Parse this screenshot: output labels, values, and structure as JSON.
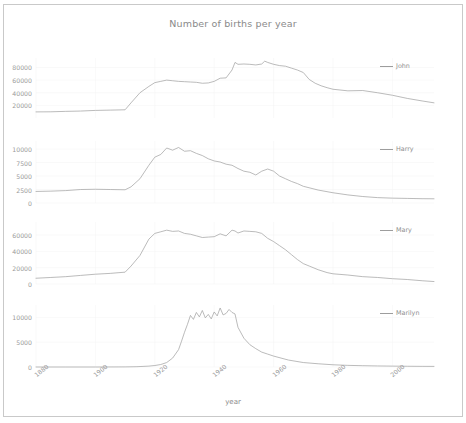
{
  "figure": {
    "title": "Number of births per year",
    "xlabel": "year",
    "background": "#ffffff",
    "line_color": "#9d9d9d",
    "text_color": "#8f8f8f"
  },
  "chart_data": {
    "type": "line",
    "title": "Number of births per year",
    "xlabel": "year",
    "ylabel": "",
    "grid": true,
    "legend_position": "upper right",
    "shared_x": true,
    "xlim": [
      1880,
      2014
    ],
    "xticks": [
      1880,
      1900,
      1920,
      1940,
      1960,
      1980,
      2000
    ],
    "subplots": [
      {
        "name": "John",
        "legend": "John",
        "ylim": [
          0,
          95000
        ],
        "yticks": [
          20000,
          40000,
          60000,
          80000
        ],
        "x": [
          1880,
          1885,
          1890,
          1895,
          1900,
          1905,
          1910,
          1912,
          1915,
          1918,
          1920,
          1922,
          1924,
          1926,
          1928,
          1930,
          1932,
          1934,
          1936,
          1938,
          1940,
          1942,
          1944,
          1946,
          1947,
          1948,
          1950,
          1952,
          1954,
          1956,
          1957,
          1958,
          1960,
          1962,
          1964,
          1966,
          1968,
          1970,
          1972,
          1974,
          1976,
          1978,
          1980,
          1985,
          1990,
          1995,
          2000,
          2005,
          2010,
          2014
        ],
        "y": [
          9655,
          9800,
          10500,
          11000,
          12000,
          12500,
          13000,
          24000,
          40000,
          50000,
          56000,
          58000,
          60000,
          59000,
          58000,
          57500,
          57000,
          56500,
          55000,
          55500,
          58000,
          63000,
          63500,
          76000,
          88000,
          85000,
          85500,
          85000,
          84000,
          85500,
          90000,
          88000,
          85000,
          83000,
          82000,
          79000,
          76000,
          72000,
          61000,
          55000,
          51000,
          48000,
          45500,
          43000,
          43500,
          40000,
          36000,
          31000,
          27000,
          24000
        ]
      },
      {
        "name": "Harry",
        "legend": "Harry",
        "ylim": [
          0,
          11500
        ],
        "yticks": [
          0,
          2500,
          5000,
          7500,
          10000
        ],
        "x": [
          1880,
          1885,
          1890,
          1895,
          1900,
          1905,
          1910,
          1912,
          1915,
          1918,
          1920,
          1922,
          1924,
          1926,
          1928,
          1930,
          1932,
          1934,
          1936,
          1938,
          1940,
          1942,
          1944,
          1946,
          1948,
          1950,
          1952,
          1954,
          1956,
          1958,
          1960,
          1962,
          1964,
          1966,
          1968,
          1970,
          1975,
          1980,
          1985,
          1990,
          1995,
          2000,
          2005,
          2010,
          2014
        ],
        "y": [
          2143,
          2200,
          2300,
          2500,
          2550,
          2500,
          2450,
          3000,
          4500,
          7000,
          8500,
          9000,
          10200,
          9800,
          10300,
          9600,
          9700,
          9200,
          8800,
          8200,
          7800,
          7600,
          7200,
          7000,
          6400,
          5900,
          5700,
          5200,
          5900,
          6300,
          5900,
          5000,
          4500,
          4000,
          3600,
          3100,
          2400,
          1900,
          1500,
          1200,
          1000,
          900,
          850,
          800,
          780
        ]
      },
      {
        "name": "Mary",
        "legend": "Mary",
        "ylim": [
          0,
          76000
        ],
        "yticks": [
          0,
          20000,
          40000,
          60000
        ],
        "x": [
          1880,
          1885,
          1890,
          1895,
          1900,
          1905,
          1910,
          1912,
          1915,
          1918,
          1920,
          1922,
          1924,
          1926,
          1928,
          1930,
          1932,
          1934,
          1936,
          1938,
          1940,
          1942,
          1944,
          1946,
          1947,
          1948,
          1950,
          1952,
          1954,
          1956,
          1958,
          1960,
          1962,
          1964,
          1966,
          1968,
          1970,
          1972,
          1975,
          1978,
          1980,
          1985,
          1990,
          1995,
          2000,
          2005,
          2010,
          2014
        ],
        "y": [
          7065,
          8000,
          9000,
          10500,
          12000,
          13000,
          14500,
          22000,
          35000,
          55000,
          62000,
          64000,
          66000,
          64500,
          65000,
          62000,
          61000,
          59000,
          57000,
          57500,
          58000,
          61500,
          59000,
          66000,
          65000,
          62500,
          65000,
          64500,
          64000,
          62000,
          56000,
          52000,
          47000,
          42000,
          36000,
          30000,
          25000,
          22000,
          17500,
          14000,
          12500,
          11000,
          9000,
          8000,
          6500,
          5500,
          4000,
          3000
        ]
      },
      {
        "name": "Marilyn",
        "legend": "Marilyn",
        "ylim": [
          0,
          12500
        ],
        "yticks": [
          0,
          5000,
          10000
        ],
        "x": [
          1880,
          1890,
          1900,
          1910,
          1914,
          1918,
          1920,
          1922,
          1924,
          1926,
          1928,
          1929,
          1930,
          1931,
          1932,
          1933,
          1934,
          1935,
          1936,
          1937,
          1938,
          1939,
          1940,
          1941,
          1942,
          1943,
          1944,
          1945,
          1946,
          1947,
          1948,
          1950,
          1952,
          1954,
          1956,
          1958,
          1960,
          1965,
          1970,
          1975,
          1980,
          1985,
          1990,
          1995,
          2000,
          2005,
          2010,
          2014
        ],
        "y": [
          0,
          0,
          0,
          20,
          60,
          180,
          300,
          500,
          900,
          1800,
          3500,
          5200,
          7000,
          8600,
          10400,
          9600,
          11000,
          10100,
          11400,
          9900,
          10600,
          9700,
          11100,
          10300,
          11900,
          10500,
          10800,
          11600,
          11000,
          10700,
          8000,
          5800,
          4500,
          3700,
          3000,
          2600,
          2200,
          1400,
          900,
          650,
          450,
          330,
          260,
          210,
          180,
          150,
          130,
          120
        ]
      }
    ]
  },
  "axes": {
    "xticks": [
      "1880",
      "1900",
      "1920",
      "1940",
      "1960",
      "1980",
      "2000"
    ],
    "subplot_yticks": [
      [
        "80000",
        "60000",
        "40000",
        "20000"
      ],
      [
        "10000",
        "7500",
        "5000",
        "2500",
        "0"
      ],
      [
        "60000",
        "40000",
        "20000",
        "0"
      ],
      [
        "10000",
        "5000",
        "0"
      ]
    ],
    "legends": [
      "John",
      "Harry",
      "Mary",
      "Marilyn"
    ]
  }
}
